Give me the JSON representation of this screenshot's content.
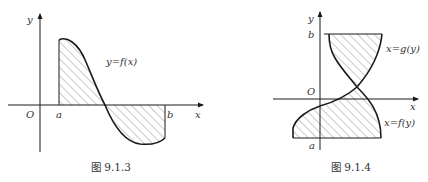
{
  "figures": [
    {
      "caption": "图 9.1.3",
      "labels": {
        "y_axis": "y",
        "x_axis": "x",
        "origin": "O",
        "a": "a",
        "b": "b",
        "curve": "y=f(x)"
      }
    },
    {
      "caption": "图 9.1.4",
      "labels": {
        "y_axis": "y",
        "x_axis": "x",
        "origin": "O",
        "a": "a",
        "b": "b",
        "curve_g": "x=g(y)",
        "curve_f": "x=f(y)"
      }
    }
  ],
  "colors": {
    "stroke": "#1a1a1a",
    "hatch": "#555555",
    "text": "#333333"
  }
}
